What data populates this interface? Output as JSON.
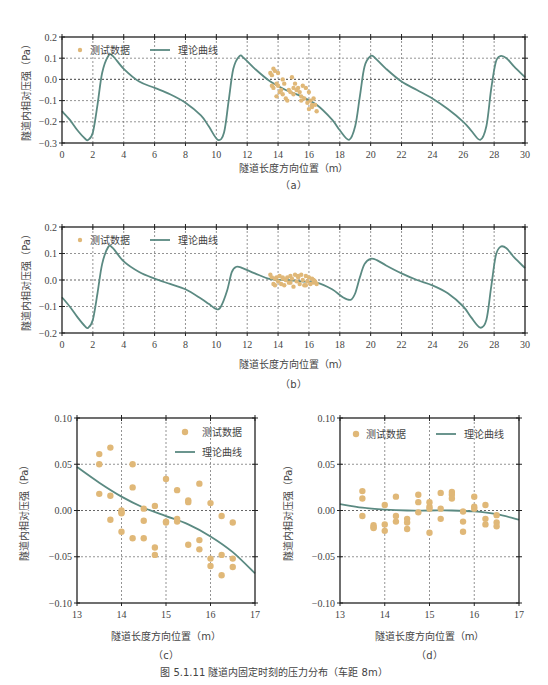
{
  "figure": {
    "caption": "图 5.1.11   隧道内固定时刻的压力分布（车距 8m）",
    "colors": {
      "curve": "#5b8a82",
      "points": "#e0b878",
      "frame": "#222222",
      "grid": "#666666"
    }
  },
  "chart_data": [
    {
      "id": "a",
      "type": "line",
      "sublabel": "（a）",
      "xlabel": "隧道长度方向位置（m）",
      "ylabel": "隧道内相对压强（Pa）",
      "xlim": [
        0,
        30
      ],
      "ylim": [
        -0.3,
        0.2
      ],
      "xticks": [
        0,
        2,
        4,
        6,
        8,
        10,
        12,
        14,
        16,
        18,
        20,
        22,
        24,
        26,
        28,
        30
      ],
      "yticks": [
        0.2,
        0.1,
        0.0,
        -0.1,
        -0.2,
        -0.3
      ],
      "ytick_labels": [
        "0.2",
        "0.1",
        "0.0",
        "−0.1",
        "−0.2",
        "−0.3"
      ],
      "grid": true,
      "legend": {
        "placement": "top-left",
        "orientation": "horizontal",
        "entries": [
          "测试数据",
          "理论曲线"
        ]
      },
      "series": [
        {
          "name": "理论曲线",
          "kind": "line",
          "x": [
            0,
            0.5,
            1.0,
            1.5,
            1.7,
            2.0,
            2.3,
            2.6,
            3.0,
            3.3,
            4.0,
            5.0,
            6.0,
            7.0,
            8.0,
            9.0,
            9.5,
            10.1,
            10.5,
            10.8,
            11.1,
            11.5,
            11.8,
            12.5,
            13.5,
            14.5,
            15.5,
            16.5,
            17.5,
            18.0,
            18.6,
            19.0,
            19.3,
            19.6,
            20.0,
            20.3,
            21.0,
            22.0,
            23.0,
            24.0,
            25.0,
            26.0,
            26.5,
            27.1,
            27.5,
            27.8,
            28.1,
            28.4,
            28.8,
            29.3,
            30.0
          ],
          "y": [
            -0.15,
            -0.19,
            -0.24,
            -0.28,
            -0.285,
            -0.25,
            -0.12,
            0.03,
            0.11,
            0.11,
            0.05,
            -0.01,
            -0.04,
            -0.07,
            -0.11,
            -0.17,
            -0.22,
            -0.285,
            -0.25,
            -0.1,
            0.05,
            0.11,
            0.1,
            0.05,
            -0.01,
            -0.05,
            -0.08,
            -0.12,
            -0.19,
            -0.24,
            -0.285,
            -0.22,
            -0.08,
            0.06,
            0.11,
            0.1,
            0.05,
            -0.01,
            -0.05,
            -0.09,
            -0.14,
            -0.2,
            -0.24,
            -0.285,
            -0.22,
            -0.05,
            0.08,
            0.11,
            0.1,
            0.06,
            0.01
          ]
        },
        {
          "name": "测试数据",
          "kind": "scatter",
          "x": [
            13.5,
            13.6,
            13.7,
            13.8,
            13.6,
            13.9,
            14.0,
            14.1,
            13.7,
            13.9,
            14.2,
            14.3,
            14.0,
            14.4,
            14.5,
            14.6,
            14.3,
            14.7,
            14.8,
            14.9,
            15.0,
            15.1,
            15.2,
            15.3,
            15.0,
            15.4,
            15.5,
            15.6,
            15.7,
            15.8,
            15.5,
            15.9,
            16.0,
            16.1,
            16.2,
            16.3,
            16.0,
            16.4,
            16.5,
            16.2
          ],
          "y": [
            0.03,
            0.02,
            0.05,
            0.04,
            -0.03,
            -0.02,
            0.03,
            -0.06,
            -0.04,
            -0.08,
            -0.05,
            -0.07,
            -0.03,
            -0.02,
            -0.09,
            -0.1,
            0.0,
            -0.05,
            -0.06,
            0.01,
            -0.04,
            -0.02,
            -0.05,
            -0.04,
            -0.07,
            -0.06,
            -0.08,
            -0.03,
            -0.09,
            -0.04,
            -0.1,
            -0.11,
            -0.06,
            -0.1,
            -0.12,
            -0.09,
            -0.14,
            -0.12,
            -0.15,
            -0.13
          ]
        }
      ]
    },
    {
      "id": "b",
      "type": "line",
      "sublabel": "（b）",
      "xlabel": "隧道长度方向位置（m）",
      "ylabel": "隧道内相对压强（Pa）",
      "xlim": [
        0,
        30
      ],
      "ylim": [
        -0.2,
        0.2
      ],
      "xticks": [
        0,
        2,
        4,
        6,
        8,
        10,
        12,
        14,
        16,
        18,
        20,
        22,
        24,
        26,
        28,
        30
      ],
      "yticks": [
        0.2,
        0.1,
        0.0,
        -0.1,
        -0.2
      ],
      "ytick_labels": [
        "0.2",
        "0.1",
        "0.0",
        "−0.1",
        "−0.2"
      ],
      "grid": true,
      "legend": {
        "placement": "top-left",
        "orientation": "horizontal",
        "entries": [
          "测试数据",
          "理论曲线"
        ]
      },
      "series": [
        {
          "name": "理论曲线",
          "kind": "line",
          "x": [
            0,
            0.5,
            1.0,
            1.5,
            1.7,
            2.0,
            2.3,
            2.6,
            3.0,
            3.3,
            4.0,
            5.0,
            6.0,
            7.0,
            8.0,
            9.0,
            9.5,
            10.0,
            10.3,
            10.7,
            11.0,
            11.3,
            11.7,
            12.5,
            13.5,
            14.5,
            15.5,
            16.5,
            17.5,
            18.2,
            18.7,
            19.0,
            19.3,
            19.6,
            20.0,
            20.4,
            21.0,
            22.0,
            23.0,
            24.0,
            25.0,
            26.0,
            26.5,
            27.1,
            27.5,
            27.8,
            28.1,
            28.4,
            28.8,
            29.3,
            30.0
          ],
          "y": [
            -0.065,
            -0.1,
            -0.14,
            -0.175,
            -0.18,
            -0.15,
            -0.05,
            0.06,
            0.125,
            0.12,
            0.07,
            0.03,
            0.005,
            -0.015,
            -0.035,
            -0.07,
            -0.09,
            -0.11,
            -0.1,
            -0.04,
            0.03,
            0.05,
            0.045,
            0.025,
            0.003,
            0.0,
            -0.005,
            -0.01,
            -0.035,
            -0.065,
            -0.075,
            -0.05,
            0.01,
            0.06,
            0.08,
            0.075,
            0.055,
            0.025,
            0.0,
            -0.02,
            -0.05,
            -0.1,
            -0.14,
            -0.18,
            -0.15,
            -0.03,
            0.09,
            0.125,
            0.12,
            0.085,
            0.045
          ]
        },
        {
          "name": "测试数据",
          "kind": "scatter",
          "x": [
            13.5,
            13.6,
            13.7,
            13.8,
            13.9,
            14.0,
            14.1,
            14.2,
            14.3,
            14.4,
            14.5,
            14.6,
            14.7,
            14.8,
            14.9,
            15.0,
            15.1,
            15.2,
            15.3,
            15.4,
            15.5,
            15.6,
            15.7,
            15.8,
            15.9,
            16.0,
            16.1,
            16.2,
            16.3,
            16.4,
            16.5,
            13.8,
            14.3,
            14.8,
            15.3,
            15.8,
            16.3
          ],
          "y": [
            0.02,
            0.01,
            -0.015,
            -0.02,
            0.01,
            -0.005,
            0.015,
            -0.015,
            0.005,
            -0.02,
            0.0,
            0.01,
            -0.01,
            0.015,
            0.005,
            -0.025,
            0.02,
            -0.005,
            0.01,
            -0.015,
            0.02,
            0.0,
            -0.02,
            0.015,
            -0.005,
            0.01,
            -0.015,
            0.005,
            -0.01,
            -0.005,
            -0.015,
            0.005,
            0.01,
            -0.01,
            0.015,
            -0.02,
            0.0
          ]
        }
      ]
    },
    {
      "id": "c",
      "type": "scatter",
      "sublabel": "（c）",
      "xlabel": "隧道长度方向位置（m）",
      "ylabel": "隧道内相对压强（Pa）",
      "xlim": [
        13,
        17
      ],
      "ylim": [
        -0.1,
        0.1
      ],
      "xticks": [
        13,
        14,
        15,
        16,
        17
      ],
      "yticks": [
        0.1,
        0.05,
        0.0,
        -0.05,
        -0.1
      ],
      "ytick_labels": [
        "0.10",
        "0.05",
        "0.00",
        "−0.05",
        "−0.10"
      ],
      "grid": true,
      "legend": {
        "placement": "top-right",
        "orientation": "vertical",
        "entries": [
          "测试数据",
          "理论曲线"
        ]
      },
      "series": [
        {
          "name": "理论曲线",
          "kind": "line",
          "x": [
            13.0,
            13.5,
            14.0,
            14.5,
            15.0,
            15.5,
            16.0,
            16.5,
            17.0
          ],
          "y": [
            0.047,
            0.03,
            0.015,
            0.003,
            -0.006,
            -0.015,
            -0.028,
            -0.045,
            -0.068
          ]
        },
        {
          "name": "测试数据",
          "kind": "scatter",
          "x": [
            13.5,
            13.5,
            13.5,
            13.75,
            13.75,
            13.75,
            14.0,
            14.0,
            14.0,
            14.0,
            14.25,
            14.25,
            14.25,
            14.5,
            14.5,
            14.5,
            14.75,
            14.75,
            14.75,
            15.0,
            15.0,
            15.0,
            15.25,
            15.25,
            15.25,
            15.5,
            15.5,
            15.5,
            15.75,
            15.75,
            15.75,
            16.0,
            16.0,
            16.0,
            16.25,
            16.25,
            16.25,
            16.5,
            16.5,
            16.5
          ],
          "y": [
            0.061,
            0.05,
            0.018,
            0.068,
            0.016,
            -0.01,
            0.0,
            -0.003,
            -0.023,
            -0.002,
            0.05,
            0.025,
            -0.03,
            0.002,
            -0.011,
            -0.03,
            0.005,
            -0.04,
            -0.048,
            0.034,
            -0.012,
            -0.013,
            0.022,
            -0.009,
            -0.012,
            0.011,
            0.009,
            -0.037,
            0.029,
            -0.032,
            -0.042,
            0.008,
            -0.052,
            -0.06,
            -0.006,
            -0.048,
            -0.07,
            -0.013,
            -0.052,
            -0.061
          ]
        }
      ]
    },
    {
      "id": "d",
      "type": "scatter",
      "sublabel": "（d）",
      "xlabel": "隧道长度方向位置（m）",
      "ylabel": "隧道内相对压强（Pa）",
      "xlim": [
        13,
        17
      ],
      "ylim": [
        -0.1,
        0.1
      ],
      "xticks": [
        13,
        14,
        15,
        16,
        17
      ],
      "yticks": [
        0.1,
        0.05,
        0.0,
        -0.05,
        -0.1
      ],
      "ytick_labels": [
        "0.10",
        "0.05",
        "0.00",
        "−0.05",
        "−0.10"
      ],
      "grid": true,
      "legend": {
        "placement": "top",
        "orientation": "horizontal",
        "entries": [
          "测试数据",
          "理论曲线"
        ]
      },
      "series": [
        {
          "name": "理论曲线",
          "kind": "line",
          "x": [
            13.0,
            13.5,
            14.0,
            14.5,
            15.0,
            15.5,
            16.0,
            16.5,
            17.0
          ],
          "y": [
            0.007,
            0.003,
            0.001,
            0.0,
            0.0,
            0.0,
            -0.001,
            -0.004,
            -0.01
          ]
        },
        {
          "name": "测试数据",
          "kind": "scatter",
          "x": [
            13.5,
            13.5,
            13.5,
            13.75,
            13.75,
            13.75,
            14.0,
            14.0,
            14.0,
            14.25,
            14.25,
            14.25,
            14.5,
            14.5,
            14.5,
            14.75,
            14.75,
            14.75,
            15.0,
            15.0,
            15.0,
            15.0,
            15.25,
            15.25,
            15.25,
            15.5,
            15.5,
            15.5,
            15.75,
            15.75,
            15.75,
            16.0,
            16.0,
            16.0,
            16.25,
            16.25,
            16.25,
            16.5,
            16.5,
            16.5
          ],
          "y": [
            0.021,
            0.013,
            -0.006,
            -0.016,
            -0.018,
            -0.019,
            0.006,
            -0.015,
            -0.022,
            0.015,
            -0.006,
            -0.012,
            -0.009,
            -0.013,
            -0.02,
            0.017,
            0.009,
            -0.002,
            0.009,
            0.004,
            0.002,
            -0.024,
            0.019,
            0.002,
            -0.009,
            0.02,
            0.017,
            0.013,
            -0.001,
            -0.012,
            -0.023,
            0.015,
            0.004,
            0.002,
            0.006,
            -0.009,
            -0.015,
            -0.005,
            -0.013,
            -0.017
          ]
        }
      ]
    }
  ]
}
